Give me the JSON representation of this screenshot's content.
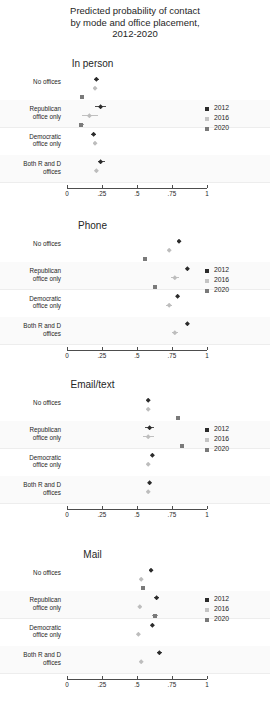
{
  "title": {
    "line1": "Predicted probability of contact",
    "line2": "by mode and office placement,",
    "line3": "2012-2020"
  },
  "legend": {
    "items": [
      {
        "label": "2012",
        "marker": "diamond-dark",
        "color": "#2b2b2b"
      },
      {
        "label": "2016",
        "marker": "diamond-light",
        "color": "#c4c4c4"
      },
      {
        "label": "2020",
        "marker": "square-mid",
        "color": "#7a7a7a"
      }
    ]
  },
  "axis": {
    "ticks": [
      "0",
      ".25",
      ".5",
      ".75",
      "1"
    ],
    "values": [
      0,
      0.25,
      0.5,
      0.75,
      1
    ]
  },
  "categories": [
    "No offices",
    "Republican\noffice only",
    "Democratic\noffice only",
    "Both R and D\noffices"
  ],
  "chart_data": {
    "type": "scatter",
    "title": "Predicted probability of contact by mode and office placement, 2012-2020",
    "xlabel": "",
    "ylabel": "",
    "xlim": [
      0,
      1
    ],
    "grid": false,
    "legend_position": "right",
    "categories": [
      "No offices",
      "Republican office only",
      "Democratic office only",
      "Both R and D offices"
    ],
    "panels": [
      {
        "title": "In person",
        "series": [
          {
            "name": "2012",
            "values": [
              0.21,
              0.24,
              0.19,
              0.24
            ],
            "ci_low": [
              0.19,
              0.2,
              0.17,
              0.22
            ],
            "ci_high": [
              0.23,
              0.28,
              0.21,
              0.27
            ]
          },
          {
            "name": "2016",
            "values": [
              0.2,
              0.16,
              0.2,
              0.21
            ],
            "ci_low": [
              0.19,
              0.11,
              0.19,
              0.2
            ],
            "ci_high": [
              0.21,
              0.22,
              0.21,
              0.22
            ]
          },
          {
            "name": "2020",
            "values": [
              0.11,
              0.1,
              null,
              null
            ],
            "ci_low": [
              0.1,
              0.09,
              null,
              null
            ],
            "ci_high": [
              0.12,
              0.12,
              null,
              null
            ]
          }
        ]
      },
      {
        "title": "Phone",
        "series": [
          {
            "name": "2012",
            "values": [
              0.8,
              0.86,
              0.79,
              0.86
            ],
            "ci_low": [
              0.79,
              0.85,
              0.78,
              0.85
            ],
            "ci_high": [
              0.81,
              0.87,
              0.8,
              0.87
            ]
          },
          {
            "name": "2016",
            "values": [
              0.73,
              0.77,
              0.73,
              0.77
            ],
            "ci_low": [
              0.72,
              0.74,
              0.71,
              0.75
            ],
            "ci_high": [
              0.74,
              0.8,
              0.75,
              0.79
            ]
          },
          {
            "name": "2020",
            "values": [
              0.56,
              0.63,
              null,
              null
            ],
            "ci_low": [
              0.55,
              0.62,
              null,
              null
            ],
            "ci_high": [
              0.57,
              0.64,
              null,
              null
            ]
          }
        ]
      },
      {
        "title": "Email/text",
        "series": [
          {
            "name": "2012",
            "values": [
              0.58,
              0.59,
              0.61,
              0.59
            ],
            "ci_low": [
              0.57,
              0.56,
              0.6,
              0.58
            ],
            "ci_high": [
              0.59,
              0.62,
              0.62,
              0.6
            ]
          },
          {
            "name": "2016",
            "values": [
              0.58,
              0.58,
              0.58,
              0.58
            ],
            "ci_low": [
              0.57,
              0.54,
              0.57,
              0.57
            ],
            "ci_high": [
              0.59,
              0.62,
              0.59,
              0.59
            ]
          },
          {
            "name": "2020",
            "values": [
              0.79,
              0.82,
              null,
              null
            ],
            "ci_low": [
              0.78,
              0.81,
              null,
              null
            ],
            "ci_high": [
              0.8,
              0.83,
              null,
              null
            ]
          }
        ]
      },
      {
        "title": "Mail",
        "series": [
          {
            "name": "2012",
            "values": [
              0.6,
              0.64,
              0.61,
              0.66
            ],
            "ci_low": [
              0.59,
              0.62,
              0.6,
              0.64
            ],
            "ci_high": [
              0.61,
              0.66,
              0.62,
              0.68
            ]
          },
          {
            "name": "2016",
            "values": [
              0.53,
              0.52,
              0.51,
              0.53
            ],
            "ci_low": [
              0.52,
              0.51,
              0.5,
              0.52
            ],
            "ci_high": [
              0.54,
              0.53,
              0.52,
              0.54
            ]
          },
          {
            "name": "2020",
            "values": [
              0.54,
              0.63,
              null,
              null
            ],
            "ci_low": [
              0.53,
              0.61,
              null,
              null
            ],
            "ci_high": [
              0.55,
              0.65,
              null,
              null
            ]
          }
        ]
      }
    ]
  }
}
